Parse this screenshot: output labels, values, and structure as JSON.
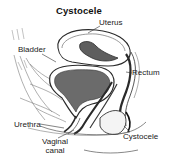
{
  "diagram": {
    "title": "Cystocele",
    "labels": {
      "uterus": "Uterus",
      "bladder": "Bladder",
      "rectum": "Rectum",
      "urethra": "Urethra",
      "cystocele": "Cystocele",
      "vaginal_canal_line1": "Vaginal",
      "vaginal_canal_line2": "canal"
    },
    "colors": {
      "organ_fill": "#6b6b6b",
      "outline": "#2a2a2a",
      "background": "#ffffff"
    }
  }
}
